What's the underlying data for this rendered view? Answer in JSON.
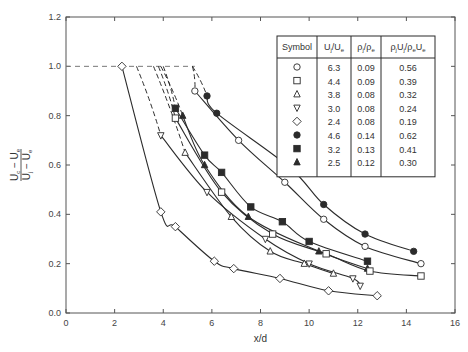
{
  "chart_data": {
    "type": "scatter",
    "title": "",
    "xlabel": "x/d",
    "ylabel": "(U_c − U_e) / (U_j − U_e)",
    "xlim": [
      0,
      16
    ],
    "ylim": [
      0,
      1.2
    ],
    "x_ticks": [
      "0",
      "2",
      "4",
      "6",
      "8",
      "10",
      "12",
      "14",
      "16"
    ],
    "y_ticks": [
      "0.0",
      "0.2",
      "0.4",
      "0.6",
      "0.8",
      "1.0",
      "1.2"
    ],
    "grid": false,
    "reference_line": {
      "y": 1.0,
      "style": "dashed",
      "x_from": 0,
      "x_to": 5.3
    },
    "legend": {
      "position": "upper right (inset table)",
      "headers": [
        "Symbol",
        "Uj/Ue",
        "ρj/ρe",
        "ρjUj/ρeUe"
      ],
      "rows": [
        {
          "symbol": "open-circle",
          "glyph": "○",
          "Uj_Ue": "6.3",
          "rho_ratio": "0.09",
          "momentum_ratio": "0.56"
        },
        {
          "symbol": "open-square",
          "glyph": "□",
          "Uj_Ue": "4.4",
          "rho_ratio": "0.09",
          "momentum_ratio": "0.39"
        },
        {
          "symbol": "open-triangle-up",
          "glyph": "△",
          "Uj_Ue": "3.8",
          "rho_ratio": "0.08",
          "momentum_ratio": "0.32"
        },
        {
          "symbol": "open-triangle-down",
          "glyph": "▽",
          "Uj_Ue": "3.0",
          "rho_ratio": "0.08",
          "momentum_ratio": "0.24"
        },
        {
          "symbol": "open-diamond",
          "glyph": "◇",
          "Uj_Ue": "2.4",
          "rho_ratio": "0.08",
          "momentum_ratio": "0.19"
        },
        {
          "symbol": "filled-circle",
          "glyph": "●",
          "Uj_Ue": "4.6",
          "rho_ratio": "0.14",
          "momentum_ratio": "0.62"
        },
        {
          "symbol": "filled-square",
          "glyph": "■",
          "Uj_Ue": "3.2",
          "rho_ratio": "0.13",
          "momentum_ratio": "0.41"
        },
        {
          "symbol": "filled-triangle-up",
          "glyph": "▲",
          "Uj_Ue": "2.5",
          "rho_ratio": "0.12",
          "momentum_ratio": "0.30"
        }
      ]
    },
    "series": [
      {
        "name": "Uj/Ue=6.3",
        "marker": "open-circle",
        "dash_start_x": 5.2,
        "x": [
          5.3,
          7.1,
          9.0,
          10.6,
          12.3,
          14.6
        ],
        "y": [
          0.9,
          0.7,
          0.53,
          0.38,
          0.27,
          0.2
        ]
      },
      {
        "name": "Uj/Ue=4.6",
        "marker": "filled-circle",
        "dash_start_x": 5.2,
        "x": [
          5.8,
          6.2,
          9.2,
          10.6,
          12.3,
          14.3
        ],
        "y": [
          0.88,
          0.81,
          0.59,
          0.44,
          0.32,
          0.25
        ]
      },
      {
        "name": "Uj/Ue=3.2",
        "marker": "filled-square",
        "dash_start_x": 4.0,
        "x": [
          4.5,
          5.7,
          6.4,
          7.6,
          8.9,
          10.0,
          12.4
        ],
        "y": [
          0.83,
          0.64,
          0.57,
          0.43,
          0.37,
          0.29,
          0.21
        ]
      },
      {
        "name": "Uj/Ue=2.5",
        "marker": "filled-triangle-up",
        "dash_start_x": 3.9,
        "x": [
          4.8,
          5.7,
          7.5,
          10.4,
          12.4
        ],
        "y": [
          0.8,
          0.6,
          0.39,
          0.25,
          0.18
        ]
      },
      {
        "name": "Uj/Ue=4.4",
        "marker": "open-square",
        "dash_start_x": 3.8,
        "x": [
          4.5,
          6.4,
          8.5,
          10.7,
          12.5,
          14.6
        ],
        "y": [
          0.79,
          0.49,
          0.32,
          0.24,
          0.17,
          0.15
        ]
      },
      {
        "name": "Uj/Ue=3.8",
        "marker": "open-triangle-up",
        "dash_start_x": 3.6,
        "x": [
          4.9,
          6.8,
          8.4,
          9.8,
          11.0
        ],
        "y": [
          0.65,
          0.39,
          0.25,
          0.2,
          0.16
        ]
      },
      {
        "name": "Uj/Ue=3.0",
        "marker": "open-triangle-down",
        "dash_start_x": 2.9,
        "x": [
          3.9,
          5.8,
          8.2,
          10.0,
          11.8,
          12.1
        ],
        "y": [
          0.72,
          0.49,
          0.3,
          0.2,
          0.14,
          0.11
        ]
      },
      {
        "name": "Uj/Ue=2.4",
        "marker": "open-diamond",
        "dash_start_x": 2.3,
        "x": [
          2.3,
          3.9,
          4.5,
          6.1,
          6.9,
          8.8,
          10.8,
          12.8
        ],
        "y": [
          1.0,
          0.41,
          0.35,
          0.21,
          0.18,
          0.14,
          0.09,
          0.07
        ]
      }
    ]
  },
  "colors": {
    "ink": "#2b2b2b",
    "axis": "#555555",
    "background": "#ffffff"
  }
}
